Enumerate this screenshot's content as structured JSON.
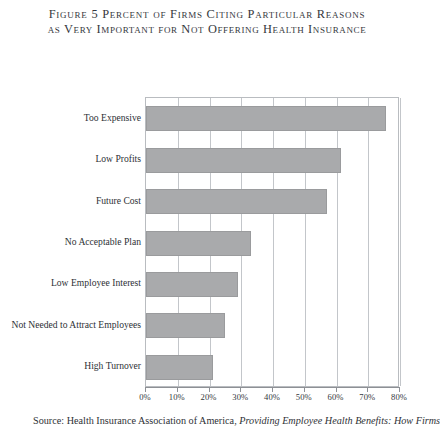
{
  "figure": {
    "title_line_1": "Figure 5  Percent of Firms Citing Particular Reasons",
    "title_line_2": "as Very Important for Not Offering Health Insurance",
    "source_prefix": "Source: Health Insurance Association of America, ",
    "source_italic": "Providing Employee Health Benefits: How Firms"
  },
  "chart_data": {
    "type": "bar",
    "orientation": "horizontal",
    "title": "Figure 5  Percent of Firms Citing Particular Reasons as Very Important for Not Offering Health Insurance",
    "xlabel": "",
    "ylabel": "",
    "xlim": [
      0,
      80
    ],
    "xtick_labels": [
      "0%",
      "10%",
      "20%",
      "30%",
      "40%",
      "50%",
      "60%",
      "70%",
      "80%"
    ],
    "xtick_values": [
      0,
      10,
      20,
      30,
      40,
      50,
      60,
      70,
      80
    ],
    "grid": true,
    "legend": false,
    "bar_color": "#a9aaac",
    "categories": [
      "Too Expensive",
      "Low Profits",
      "Future Cost",
      "No Acceptable Plan",
      "Low Employee Interest",
      "Not Needed to Attract Employees",
      "High Turnover"
    ],
    "values": [
      75.5,
      61.5,
      57,
      33,
      29,
      25,
      21
    ]
  }
}
